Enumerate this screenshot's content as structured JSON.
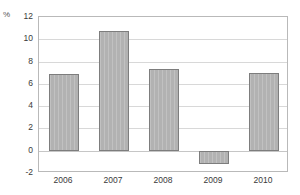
{
  "chart_data": {
    "type": "bar",
    "title": "",
    "subtitle": "",
    "xlabel": "",
    "ylabel": "%",
    "unit_label": "%",
    "categories": [
      "2006",
      "2007",
      "2008",
      "2009",
      "2010"
    ],
    "values": [
      6.9,
      10.7,
      7.3,
      -1.2,
      7.0
    ],
    "series": [
      {
        "name": "",
        "values": [
          6.9,
          10.7,
          7.3,
          -1.2,
          7.0
        ]
      }
    ],
    "ylim": [
      -2,
      12
    ],
    "ytick_step": 2,
    "yticks": [
      12,
      10,
      8,
      6,
      4,
      2,
      0,
      -2
    ],
    "ytick_labels": [
      "12",
      "10",
      "8",
      "6",
      "4",
      "2",
      "0",
      "-2"
    ],
    "grid": true,
    "grid_axis": "y",
    "legend": false,
    "legend_position": "none",
    "annotations": [],
    "colors": {
      "bar_fill": "#b2b2b2",
      "bar_border": "#7d7d7d",
      "gridline": "#d8d8d8",
      "zero_line": "#c6c6c6",
      "frame": "#b9b9b9",
      "text": "#3a3a3a",
      "background": "#ffffff"
    }
  }
}
